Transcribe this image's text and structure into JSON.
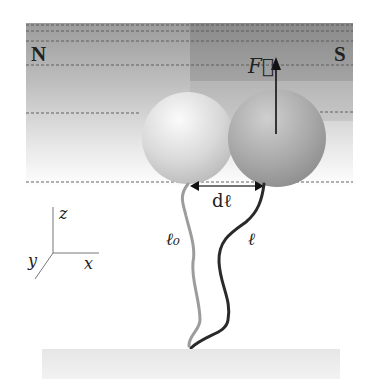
{
  "figure": {
    "magnet": {
      "north_label": "N",
      "south_label": "S"
    },
    "force_label": "F⃗",
    "displacement_label": "dℓ",
    "tether_initial_label": "ℓ₀",
    "tether_stretched_label": "ℓ",
    "axes": {
      "z": "z",
      "x": "x",
      "y": "y"
    },
    "colors": {
      "magnet_band": "#9a9a9a",
      "south_block": "#8c8c8c",
      "bead_left": "#d8d8d8",
      "bead_right": "#a8a8a8",
      "tether_initial": "#9a9a9a",
      "tether_stretched": "#2a2a2a",
      "surface": "#e4e4e4"
    }
  }
}
